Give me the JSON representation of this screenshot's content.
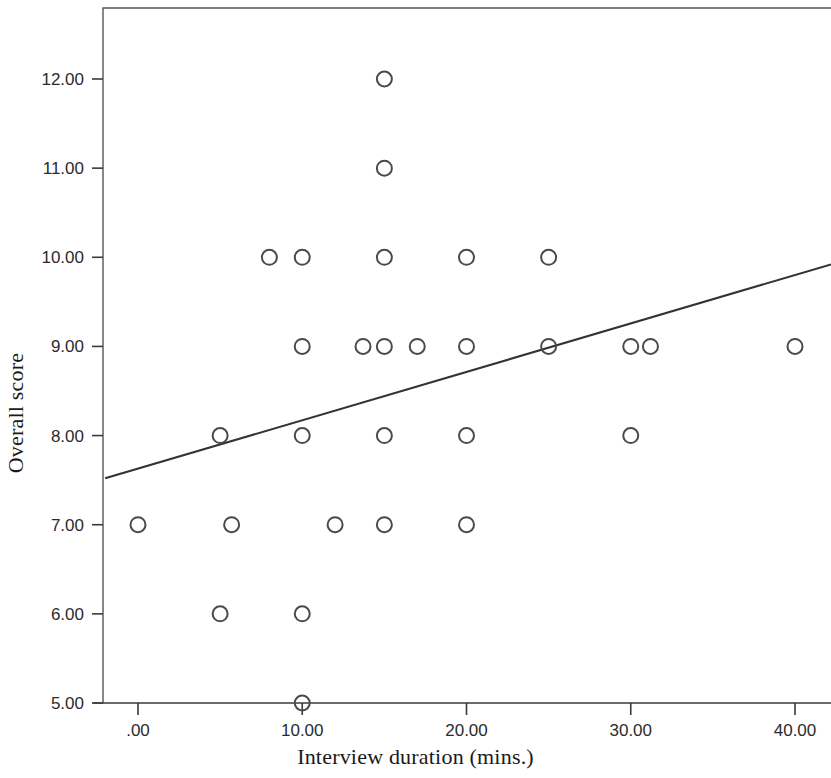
{
  "chart_data": {
    "type": "scatter",
    "title": "",
    "xlabel": "Interview duration (mins.)",
    "ylabel": "Overall score",
    "xlim": [
      -2.0,
      44.8
    ],
    "ylim": [
      4.92,
      12.78
    ],
    "grid": false,
    "legend": "none",
    "x_ticks": [
      0,
      10,
      20,
      30,
      40
    ],
    "x_tick_labels": [
      ".00",
      "10.00",
      "20.00",
      "30.00",
      "40.00"
    ],
    "y_ticks": [
      5,
      6,
      7,
      8,
      9,
      10,
      11,
      12
    ],
    "y_tick_labels": [
      "5.00",
      "6.00",
      "7.00",
      "8.00",
      "9.00",
      "10.00",
      "11.00",
      "12.00"
    ],
    "points": [
      {
        "x": 15,
        "y": 12
      },
      {
        "x": 15,
        "y": 11
      },
      {
        "x": 8,
        "y": 10
      },
      {
        "x": 10,
        "y": 10
      },
      {
        "x": 15,
        "y": 10
      },
      {
        "x": 20,
        "y": 10
      },
      {
        "x": 25,
        "y": 10
      },
      {
        "x": 10,
        "y": 9
      },
      {
        "x": 13.7,
        "y": 9
      },
      {
        "x": 15,
        "y": 9
      },
      {
        "x": 17,
        "y": 9
      },
      {
        "x": 20,
        "y": 9
      },
      {
        "x": 25,
        "y": 9
      },
      {
        "x": 30,
        "y": 9
      },
      {
        "x": 31.2,
        "y": 9
      },
      {
        "x": 40,
        "y": 9
      },
      {
        "x": 5,
        "y": 8
      },
      {
        "x": 10,
        "y": 8
      },
      {
        "x": 15,
        "y": 8
      },
      {
        "x": 20,
        "y": 8
      },
      {
        "x": 30,
        "y": 8
      },
      {
        "x": 0,
        "y": 7
      },
      {
        "x": 5.7,
        "y": 7
      },
      {
        "x": 12,
        "y": 7
      },
      {
        "x": 15,
        "y": 7
      },
      {
        "x": 20,
        "y": 7
      },
      {
        "x": 5,
        "y": 6
      },
      {
        "x": 10,
        "y": 6
      },
      {
        "x": 10,
        "y": 5
      }
    ],
    "marker": "open-circle",
    "marker_color": "#4a4a4a",
    "fit_line": {
      "kind": "linear-regression",
      "color": "#333333",
      "x_start": -2.0,
      "y_start": 7.52,
      "x_end": 44.8,
      "y_end": 9.92
    }
  }
}
